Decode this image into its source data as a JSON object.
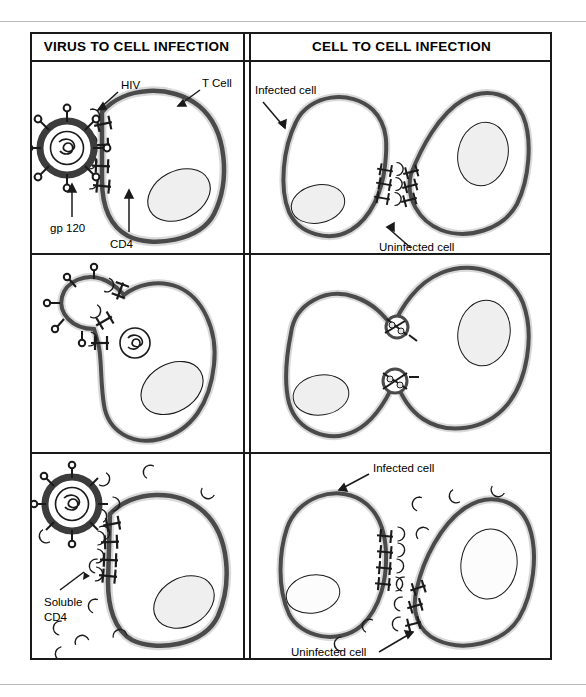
{
  "figure": {
    "headers": {
      "left": "VIRUS TO CELL INFECTION",
      "right": "CELL TO CELL INFECTION"
    },
    "panels": {
      "r1c1": {
        "name": "virus-to-cell-attachment",
        "labels": {
          "hiv": "HIV",
          "tcell": "T Cell",
          "gp120": "gp 120",
          "cd4": "CD4"
        }
      },
      "r1c2": {
        "name": "cell-to-cell-attachment",
        "labels": {
          "infected": "Infected cell",
          "uninfected": "Uninfected cell"
        }
      },
      "r2c1": {
        "name": "virus-to-cell-fusion",
        "labels": {}
      },
      "r2c2": {
        "name": "cell-to-cell-fusion",
        "labels": {}
      },
      "r3c1": {
        "name": "virus-to-cell-blocked-by-soluble-cd4",
        "labels": {
          "soluble_cd4_line1": "Soluble",
          "soluble_cd4_line2": "CD4"
        }
      },
      "r3c2": {
        "name": "cell-to-cell-blocked-by-soluble-cd4",
        "labels": {
          "infected": "Infected cell",
          "uninfected": "Uninfected cell"
        }
      }
    },
    "colors": {
      "ink": "#1a1a1a",
      "membrane_dark": "#4a4a4a",
      "membrane_light": "#d9d9d9",
      "nucleus_fill": "#eeeeee",
      "cd4_fill": "#e2e2e2",
      "virus_ring": "#3c3c3c",
      "rule": "#b9b9b9"
    }
  }
}
